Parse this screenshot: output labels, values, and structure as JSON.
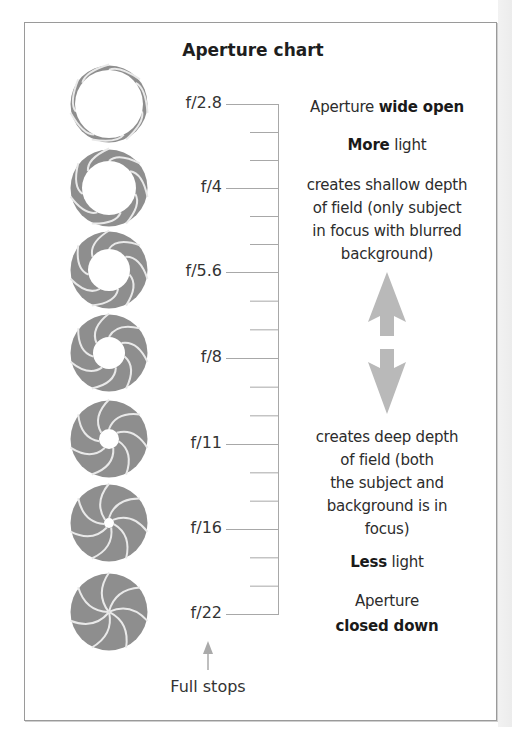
{
  "title": "Aperture chart",
  "colors": {
    "blade_fill": "#8e8e8e",
    "blade_gap": "#e9e9e9",
    "ladder": "#a8a8a8",
    "arrows": "#b9b9b9",
    "border": "#9a9a9a"
  },
  "f_stops": [
    {
      "label": "f/2.8",
      "hole_radius": 34
    },
    {
      "label": "f/4",
      "hole_radius": 27
    },
    {
      "label": "f/5.6",
      "hole_radius": 21
    },
    {
      "label": "f/8",
      "hole_radius": 16
    },
    {
      "label": "f/11",
      "hole_radius": 10
    },
    {
      "label": "f/16",
      "hole_radius": 5
    },
    {
      "label": "f/22",
      "hole_radius": 0
    }
  ],
  "ladder": {
    "intermediate_ticks_per_stop": 2,
    "footer_label": "Full stops"
  },
  "wide_open": {
    "line1_regular": "Aperture ",
    "line1_bold": "wide open",
    "line2_bold": "More",
    "line2_regular": " light",
    "description": [
      "creates shallow depth",
      "of field (only subject",
      "in focus with blurred",
      "background)"
    ]
  },
  "closed_down": {
    "description": [
      "creates deep depth",
      "of field (both",
      "the subject and",
      "background is in",
      "focus)"
    ],
    "line1_bold": "Less",
    "line1_regular": " light",
    "line2_regular": "Aperture",
    "line2_bold": "closed down"
  },
  "direction_arrows": [
    "up-arrow",
    "down-arrow"
  ]
}
